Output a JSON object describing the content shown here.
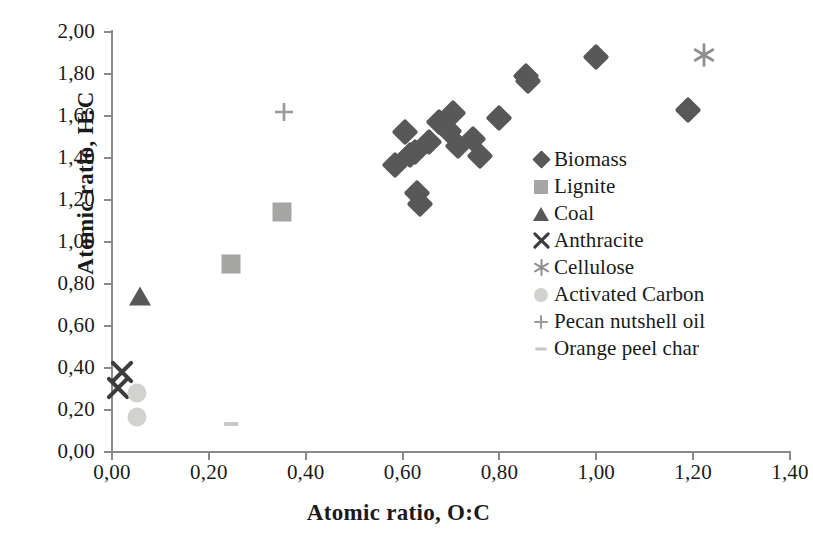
{
  "chart_data": {
    "type": "scatter",
    "title": "",
    "xlabel": "Atomic ratio, O:C",
    "ylabel": "Atomic ratio, H:C",
    "xlim": [
      0.0,
      1.4
    ],
    "ylim": [
      0.0,
      2.0
    ],
    "xticks": [
      "0,00",
      "0,20",
      "0,40",
      "0,60",
      "0,80",
      "1,00",
      "1,20",
      "1,40"
    ],
    "xtick_values": [
      0.0,
      0.2,
      0.4,
      0.6,
      0.8,
      1.0,
      1.2,
      1.4
    ],
    "yticks": [
      "0,00",
      "0,20",
      "0,40",
      "0,60",
      "0,80",
      "1,00",
      "1,20",
      "1,40",
      "1,60",
      "1,80",
      "2,00"
    ],
    "ytick_values": [
      0.0,
      0.2,
      0.4,
      0.6,
      0.8,
      1.0,
      1.2,
      1.4,
      1.6,
      1.8,
      2.0
    ],
    "grid": false,
    "legend_position": "center-right",
    "decimal_separator": ",",
    "series": [
      {
        "name": "Biomass",
        "marker": "diamond",
        "color": "#585858",
        "points": [
          [
            0.585,
            1.365
          ],
          [
            0.605,
            1.525
          ],
          [
            0.615,
            1.415
          ],
          [
            0.625,
            1.43
          ],
          [
            0.63,
            1.235
          ],
          [
            0.635,
            1.18
          ],
          [
            0.655,
            1.475
          ],
          [
            0.675,
            1.57
          ],
          [
            0.695,
            1.53
          ],
          [
            0.705,
            1.615
          ],
          [
            0.715,
            1.455
          ],
          [
            0.745,
            1.49
          ],
          [
            0.76,
            1.41
          ],
          [
            0.8,
            1.59
          ],
          [
            0.855,
            1.79
          ],
          [
            0.86,
            1.765
          ],
          [
            1.0,
            1.88
          ],
          [
            1.19,
            1.63
          ]
        ]
      },
      {
        "name": "Lignite",
        "marker": "square",
        "color": "#a6a6a4",
        "points": [
          [
            0.245,
            0.895
          ],
          [
            0.35,
            1.145
          ]
        ]
      },
      {
        "name": "Coal",
        "marker": "triangle",
        "color": "#585858",
        "points": [
          [
            0.057,
            0.745
          ]
        ]
      },
      {
        "name": "Anthracite",
        "marker": "x",
        "color": "#3c3c3c",
        "points": [
          [
            0.02,
            0.38
          ],
          [
            0.013,
            0.305
          ]
        ]
      },
      {
        "name": "Cellulose",
        "marker": "asterisk",
        "color": "#8e8e8c",
        "points": [
          [
            1.222,
            1.89
          ]
        ]
      },
      {
        "name": "Activated Carbon",
        "marker": "circle",
        "color": "#d2d2d0",
        "points": [
          [
            0.052,
            0.28
          ],
          [
            0.052,
            0.165
          ]
        ]
      },
      {
        "name": "Pecan nutshell oil",
        "marker": "plus",
        "color": "#9a9a98",
        "points": [
          [
            0.355,
            1.62
          ]
        ]
      },
      {
        "name": "Orange peel char",
        "marker": "dash",
        "color": "#c8c8c6",
        "points": [
          [
            0.245,
            0.135
          ]
        ]
      }
    ]
  },
  "legend": {
    "entries": [
      {
        "label": "Biomass",
        "marker": "diamond"
      },
      {
        "label": "Lignite",
        "marker": "square"
      },
      {
        "label": "Coal",
        "marker": "triangle"
      },
      {
        "label": "Anthracite",
        "marker": "x"
      },
      {
        "label": "Cellulose",
        "marker": "asterisk"
      },
      {
        "label": "Activated Carbon",
        "marker": "circle"
      },
      {
        "label": "Pecan nutshell oil",
        "marker": "plus"
      },
      {
        "label": "Orange peel char",
        "marker": "dash"
      }
    ]
  },
  "colors": {
    "dark_marker": "#585858",
    "mid_marker": "#a6a6a4",
    "light_marker": "#d2d2d0",
    "axis": "#8a8a86",
    "text": "#1a1a1a"
  }
}
